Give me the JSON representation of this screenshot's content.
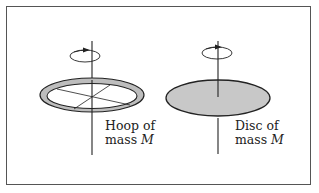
{
  "figure": {
    "hoop": {
      "label_line1": "Hoop of",
      "label_line2_prefix": "mass ",
      "label_line2_var": "M",
      "fill_color": "#bdbdbd"
    },
    "disc": {
      "label_line1": "Disc of",
      "label_line2_prefix": "mass ",
      "label_line2_var": "M",
      "fill_color": "#c8c8c8"
    },
    "stroke_color": "#222222"
  }
}
